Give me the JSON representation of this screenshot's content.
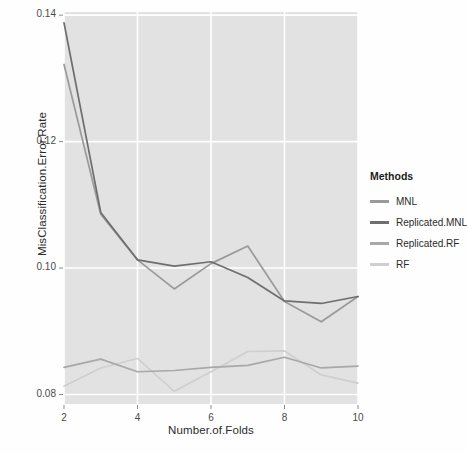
{
  "chart_data": {
    "type": "line",
    "title": "",
    "xlabel": "Number.of.Folds",
    "ylabel": "MisClassification.Error.Rate",
    "x": [
      2,
      3,
      4,
      5,
      6,
      7,
      8,
      9,
      10
    ],
    "xlim": [
      2,
      10
    ],
    "ylim": [
      0.0785,
      0.1405
    ],
    "xticks": [
      2,
      4,
      6,
      8,
      10
    ],
    "xtick_labels": [
      "2",
      "4",
      "6",
      "8",
      "10"
    ],
    "yticks": [
      0.08,
      0.1,
      0.12,
      0.14
    ],
    "ytick_labels": [
      "0.08",
      "0.10",
      "0.12",
      "0.14"
    ],
    "grid": true,
    "panel_background": "#e2e2e2",
    "grid_color": "#ffffff",
    "legend_position": "right",
    "legend_title": "Methods",
    "series": [
      {
        "name": "MNL",
        "color": "#9a9a9a",
        "values": [
          0.1322,
          0.1085,
          0.1013,
          0.0967,
          0.1007,
          0.1035,
          0.0947,
          0.0915,
          0.0955
        ]
      },
      {
        "name": "Replicated.MNL",
        "color": "#6e6e6e",
        "values": [
          0.1388,
          0.1088,
          0.1013,
          0.1003,
          0.101,
          0.0985,
          0.0948,
          0.0944,
          0.0955
        ]
      },
      {
        "name": "Replicated.RF",
        "color": "#a8a8a8",
        "values": [
          0.0843,
          0.0856,
          0.0836,
          0.0838,
          0.0843,
          0.0846,
          0.0859,
          0.0842,
          0.0845
        ]
      },
      {
        "name": "RF",
        "color": "#cfcfcf",
        "values": [
          0.0813,
          0.0842,
          0.0857,
          0.0805,
          0.0836,
          0.0868,
          0.0869,
          0.0831,
          0.0818
        ]
      }
    ]
  }
}
